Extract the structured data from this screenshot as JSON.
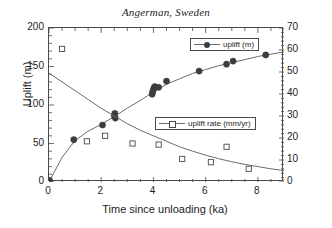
{
  "chart_data": {
    "type": "scatter",
    "title": "Angerman, Sweden",
    "xlabel": "Time since unloading (ka)",
    "ylabel": "Uplift (m)",
    "ylabel_right": "Uplift rate (mm/yr)",
    "xlim": [
      0,
      9
    ],
    "ylim": [
      0,
      200
    ],
    "ylim_right": [
      0,
      70
    ],
    "xticks": [
      0,
      2,
      4,
      6,
      8
    ],
    "xtick_labels": [
      "0",
      "2",
      "4",
      "6",
      "8"
    ],
    "yticks": [
      0,
      50,
      100,
      150,
      200
    ],
    "ytick_labels": [
      "0",
      "50",
      "100",
      "150",
      "200"
    ],
    "yticks_right": [
      0,
      10,
      20,
      30,
      40,
      50,
      60,
      70
    ],
    "ytick_labels_right": [
      "0",
      "10",
      "20",
      "30",
      "40",
      "50",
      "60",
      "70"
    ],
    "xminor_step": 0.5,
    "yminor_step": 10,
    "yminor_step_right": 2,
    "grid": false,
    "legend_position": "inside-right",
    "series": [
      {
        "name": "uplift (m)",
        "marker": "filled-circle",
        "axis": "left",
        "color": "#3d3d3d",
        "line_color": "#6b6b6b",
        "points": [
          {
            "x": 0.02,
            "y": 2
          },
          {
            "x": 0.95,
            "y": 55
          },
          {
            "x": 2.05,
            "y": 74
          },
          {
            "x": 2.5,
            "y": 86
          },
          {
            "x": 2.52,
            "y": 89
          },
          {
            "x": 2.54,
            "y": 83
          },
          {
            "x": 3.95,
            "y": 114
          },
          {
            "x": 3.97,
            "y": 117
          },
          {
            "x": 4.0,
            "y": 120
          },
          {
            "x": 4.02,
            "y": 122
          },
          {
            "x": 4.05,
            "y": 124
          },
          {
            "x": 4.2,
            "y": 123
          },
          {
            "x": 4.5,
            "y": 131
          },
          {
            "x": 5.75,
            "y": 144
          },
          {
            "x": 6.8,
            "y": 153
          },
          {
            "x": 7.05,
            "y": 157
          },
          {
            "x": 8.3,
            "y": 165
          }
        ],
        "curve": [
          {
            "x": 0,
            "y": 0
          },
          {
            "x": 0.5,
            "y": 32
          },
          {
            "x": 1.0,
            "y": 54
          },
          {
            "x": 1.5,
            "y": 66
          },
          {
            "x": 2.0,
            "y": 75
          },
          {
            "x": 2.5,
            "y": 85
          },
          {
            "x": 3.0,
            "y": 96
          },
          {
            "x": 3.5,
            "y": 106
          },
          {
            "x": 4.0,
            "y": 117
          },
          {
            "x": 4.5,
            "y": 127
          },
          {
            "x": 5.0,
            "y": 134
          },
          {
            "x": 5.5,
            "y": 141
          },
          {
            "x": 6.0,
            "y": 146
          },
          {
            "x": 6.5,
            "y": 151
          },
          {
            "x": 7.0,
            "y": 155
          },
          {
            "x": 7.5,
            "y": 159
          },
          {
            "x": 8.0,
            "y": 163
          },
          {
            "x": 8.5,
            "y": 166
          },
          {
            "x": 9.0,
            "y": 169
          }
        ]
      },
      {
        "name": "uplift rate (mm/yr)",
        "marker": "open-square",
        "axis": "right",
        "color": "#4a4a4a",
        "line_color": "#6b6b6b",
        "points": [
          {
            "x": 0.5,
            "y": 60.5
          },
          {
            "x": 1.45,
            "y": 18.5
          },
          {
            "x": 2.15,
            "y": 21.0
          },
          {
            "x": 3.2,
            "y": 17.5
          },
          {
            "x": 4.2,
            "y": 17.0
          },
          {
            "x": 5.1,
            "y": 10.5
          },
          {
            "x": 6.2,
            "y": 9.0
          },
          {
            "x": 6.8,
            "y": 16.0
          },
          {
            "x": 7.65,
            "y": 6.0
          }
        ],
        "curve": [
          {
            "x": 0,
            "y": 49.5
          },
          {
            "x": 0.5,
            "y": 45.5
          },
          {
            "x": 1.0,
            "y": 41.5
          },
          {
            "x": 1.5,
            "y": 37.5
          },
          {
            "x": 2.0,
            "y": 33.5
          },
          {
            "x": 2.5,
            "y": 30.0
          },
          {
            "x": 3.0,
            "y": 26.5
          },
          {
            "x": 3.5,
            "y": 23.5
          },
          {
            "x": 4.0,
            "y": 21.0
          },
          {
            "x": 4.5,
            "y": 18.5
          },
          {
            "x": 5.0,
            "y": 16.0
          },
          {
            "x": 5.5,
            "y": 14.0
          },
          {
            "x": 6.0,
            "y": 12.2
          },
          {
            "x": 6.5,
            "y": 10.6
          },
          {
            "x": 7.0,
            "y": 9.2
          },
          {
            "x": 7.5,
            "y": 8.0
          },
          {
            "x": 8.0,
            "y": 7.0
          },
          {
            "x": 8.5,
            "y": 6.0
          },
          {
            "x": 9.0,
            "y": 5.2
          }
        ]
      }
    ]
  },
  "legend": {
    "uplift_label": "uplift (m)",
    "rate_label": "uplift rate (mm/yr)"
  },
  "colors": {
    "axis": "#4a4a4a",
    "curve": "#6b6b6b",
    "marker_filled": "#3d3d3d",
    "marker_open_border": "#4a4a4a",
    "background": "#ffffff"
  }
}
